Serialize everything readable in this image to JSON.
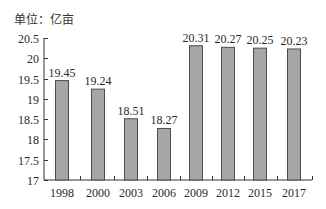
{
  "chart_data": {
    "type": "bar",
    "title": "",
    "unit_label": "单位：亿亩",
    "xlabel": "",
    "ylabel": "单位：亿亩",
    "categories": [
      "1998",
      "2000",
      "2003",
      "2006",
      "2009",
      "2012",
      "2015",
      "2017"
    ],
    "values": [
      19.45,
      19.24,
      18.51,
      18.27,
      20.31,
      20.27,
      20.25,
      20.23
    ],
    "value_labels": [
      "19.45",
      "19.24",
      "18.51",
      "18.27",
      "20.31",
      "20.27",
      "20.25",
      "20.23"
    ],
    "ylim": [
      17,
      20.5
    ],
    "yticks": [
      17,
      17.5,
      18,
      18.5,
      19,
      19.5,
      20,
      20.5
    ],
    "ytick_labels": [
      "17",
      "17.5",
      "18",
      "18.5",
      "19",
      "19.5",
      "20",
      "20.5"
    ],
    "grid": false,
    "legend": null,
    "colors": {
      "bar_fill": "#a6a6a6",
      "bar_edge": "#4d4d4d",
      "axis": "#333333"
    }
  }
}
